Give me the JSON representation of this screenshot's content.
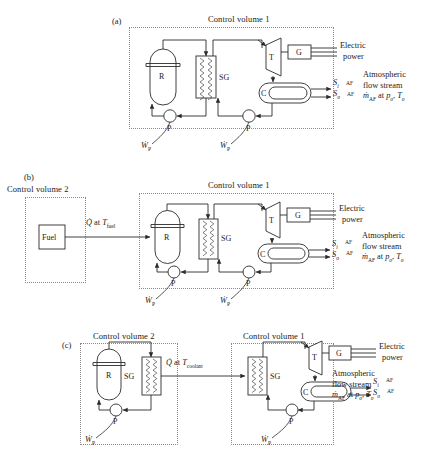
{
  "figure": {
    "type": "diagram"
  },
  "panels": [
    {
      "id": "a",
      "label": "(a)",
      "control_volumes": [
        {
          "name": "Control volume 1",
          "id": "cv1"
        }
      ],
      "components": [
        {
          "id": "R",
          "label": "R",
          "name": "reactor"
        },
        {
          "id": "SG",
          "label": "SG",
          "name": "steam-generator"
        },
        {
          "id": "T",
          "label": "T",
          "name": "turbine"
        },
        {
          "id": "G",
          "label": "G",
          "name": "generator"
        },
        {
          "id": "C",
          "label": "C",
          "name": "condenser"
        },
        {
          "id": "P1",
          "label": "P",
          "name": "pump-primary"
        },
        {
          "id": "P2",
          "label": "P",
          "name": "pump-secondary"
        }
      ],
      "work_labels": [
        "ẆP",
        "ẆP"
      ],
      "outputs": {
        "electric": "Electric\npower",
        "stream_in": "(Sᵢ)AF",
        "stream_out": "(Sₒ)AF",
        "atmospheric": "Atmospheric\nflow stream\nṁAF at pₒ, Tₒ"
      }
    },
    {
      "id": "b",
      "label": "(b)",
      "control_volumes": [
        {
          "name": "Control volume 2",
          "id": "cv2"
        },
        {
          "name": "Control volume 1",
          "id": "cv1"
        }
      ],
      "components": [
        {
          "id": "Fuel",
          "label": "Fuel",
          "name": "fuel-box"
        },
        {
          "id": "R",
          "label": "R",
          "name": "reactor"
        },
        {
          "id": "SG",
          "label": "SG",
          "name": "steam-generator"
        },
        {
          "id": "T",
          "label": "T",
          "name": "turbine"
        },
        {
          "id": "G",
          "label": "G",
          "name": "generator"
        },
        {
          "id": "C",
          "label": "C",
          "name": "condenser"
        },
        {
          "id": "P1",
          "label": "P",
          "name": "pump-primary"
        },
        {
          "id": "P2",
          "label": "P",
          "name": "pump-secondary"
        }
      ],
      "heat_label": "Q̇ at Tfuel",
      "work_labels": [
        "ẆP",
        "ẆP"
      ],
      "outputs": {
        "electric": "Electric\npower",
        "stream_in": "(Sᵢ)AF",
        "stream_out": "(Sₒ)AF",
        "atmospheric": "Atmospheric\nflow stream\nṁAF at pₒ, Tₒ"
      }
    },
    {
      "id": "c",
      "label": "(c)",
      "control_volumes": [
        {
          "name": "Control volume 2",
          "id": "cv2"
        },
        {
          "name": "Control volume 1",
          "id": "cv1"
        }
      ],
      "components": [
        {
          "id": "R",
          "label": "R",
          "name": "reactor"
        },
        {
          "id": "SGL",
          "label": "SG",
          "name": "steam-generator-left"
        },
        {
          "id": "SGR",
          "label": "SG",
          "name": "steam-generator-right"
        },
        {
          "id": "T",
          "label": "T",
          "name": "turbine"
        },
        {
          "id": "G",
          "label": "G",
          "name": "generator"
        },
        {
          "id": "C",
          "label": "C",
          "name": "condenser"
        },
        {
          "id": "P1",
          "label": "P",
          "name": "pump-primary"
        },
        {
          "id": "P2",
          "label": "P",
          "name": "pump-secondary"
        }
      ],
      "heat_label": "Q̇ at Tcoolant",
      "work_labels": [
        "ẆP",
        "ẆP"
      ],
      "outputs": {
        "electric": "Electric\npower",
        "stream_in": "(Sᵢ)AF",
        "stream_out": "(Sₒ)AF",
        "atmospheric": "Atmospheric\nflow stream\nṁAF at pₒ, Tₒ"
      }
    }
  ],
  "text": {
    "control_volume_1": "Control volume 1",
    "control_volume_2": "Control volume 2",
    "panel_a": "(a)",
    "panel_b": "(b)",
    "panel_c": "(c)",
    "reactor": "R",
    "steam_generator": "SG",
    "turbine": "T",
    "generator": "G",
    "condenser": "C",
    "pump": "P",
    "fuel": "Fuel",
    "electric_line1": "Electric",
    "electric_line2": "power",
    "atmos_line1": "Atmospheric",
    "atmos_line2": "flow stream",
    "q_at": "at",
    "t_fuel_sub": "fuel",
    "t_coolant_sub": "coolant",
    "sub_i": "i",
    "sub_o": "o",
    "sub_AF": "AF"
  },
  "colors": {
    "line": "#2b2b2b",
    "dotted_boundary": "#8a8a8a",
    "coil": "#4a4a4a",
    "background": "#ffffff",
    "text": "#1a1a1a"
  }
}
